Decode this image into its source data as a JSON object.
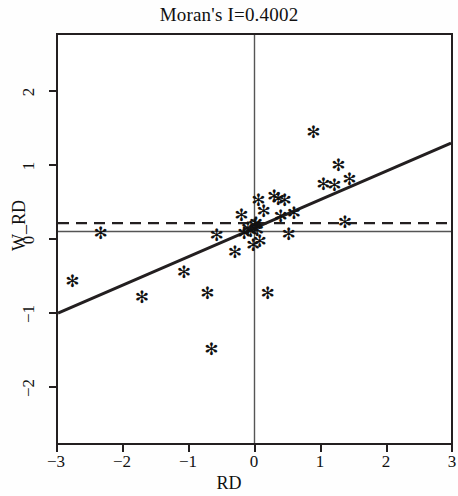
{
  "chart_data": {
    "type": "scatter",
    "title": "Moran's I=0.4002",
    "xlabel": "RD",
    "ylabel": "W_RD",
    "xlim": [
      -3,
      3
    ],
    "ylim": [
      -2.8,
      2.6
    ],
    "xticks": [
      -3,
      -2,
      -1,
      0,
      1,
      2,
      3
    ],
    "xtick_labels": [
      "−3",
      "−2",
      "−1",
      "0",
      "1",
      "2",
      "3"
    ],
    "yticks": [
      -2,
      -1,
      0,
      1,
      2
    ],
    "ytick_labels": [
      "−2",
      "−1",
      "0",
      "1",
      "2"
    ],
    "grid": false,
    "legend": null,
    "marker": "asterisk",
    "marker_symbol": "✻",
    "marker_color": "#111111",
    "moran_i": 0.4002,
    "points": [
      {
        "x": -2.78,
        "y": -0.66
      },
      {
        "x": -2.35,
        "y": -0.02
      },
      {
        "x": -1.72,
        "y": -0.87
      },
      {
        "x": -1.08,
        "y": -0.54
      },
      {
        "x": -0.72,
        "y": -0.82
      },
      {
        "x": -0.66,
        "y": -1.55
      },
      {
        "x": -0.58,
        "y": -0.05
      },
      {
        "x": -0.3,
        "y": -0.27
      },
      {
        "x": -0.2,
        "y": 0.22
      },
      {
        "x": -0.16,
        "y": -0.02
      },
      {
        "x": -0.1,
        "y": 0.04
      },
      {
        "x": -0.06,
        "y": 0.01
      },
      {
        "x": -0.02,
        "y": -0.18
      },
      {
        "x": 0.0,
        "y": 0.09
      },
      {
        "x": 0.02,
        "y": 0.11
      },
      {
        "x": 0.04,
        "y": 0.02
      },
      {
        "x": 0.06,
        "y": 0.42
      },
      {
        "x": 0.08,
        "y": -0.13
      },
      {
        "x": 0.14,
        "y": 0.27
      },
      {
        "x": 0.2,
        "y": -0.82
      },
      {
        "x": 0.3,
        "y": 0.47
      },
      {
        "x": 0.36,
        "y": 0.43
      },
      {
        "x": 0.4,
        "y": 0.2
      },
      {
        "x": 0.46,
        "y": 0.42
      },
      {
        "x": 0.52,
        "y": -0.03
      },
      {
        "x": 0.6,
        "y": 0.25
      },
      {
        "x": 0.9,
        "y": 1.32
      },
      {
        "x": 1.05,
        "y": 0.63
      },
      {
        "x": 1.22,
        "y": 0.62
      },
      {
        "x": 1.28,
        "y": 0.88
      },
      {
        "x": 1.38,
        "y": 0.13
      },
      {
        "x": 1.45,
        "y": 0.7
      }
    ],
    "regression_line": {
      "x": [
        -3,
        3
      ],
      "y": [
        -1.08,
        1.17
      ],
      "style": "solid",
      "color": "#231f20"
    },
    "reference_lines": [
      {
        "orientation": "horizontal",
        "value": 0.0,
        "style": "solid",
        "color": "#555555"
      },
      {
        "orientation": "vertical",
        "value": 0.0,
        "style": "solid",
        "color": "#555555"
      },
      {
        "orientation": "horizontal",
        "value": 0.11,
        "style": "dashed",
        "color": "#231f20"
      }
    ]
  }
}
